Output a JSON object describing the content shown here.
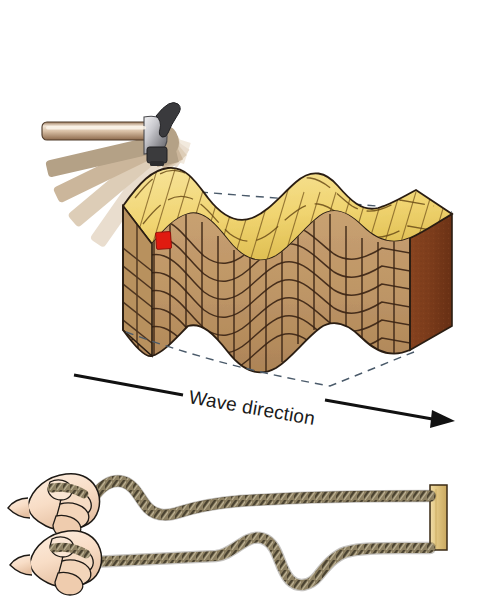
{
  "figure": {
    "background_color": "#ffffff",
    "width": 478,
    "height": 608
  },
  "panel_top": {
    "name": "hammer-and-wood-block-panel",
    "hammer": {
      "label": "hammer",
      "handle_color": "#c3a183",
      "handle_highlight": "#f3e7d8",
      "head_color": "#c8c8cc",
      "head_shadow": "#6e6e72",
      "face_color": "#3b3b3d",
      "ghost_label": "motion-blur-ghost-trail",
      "ghost_count": 5,
      "ghost_colors": [
        "#f0e6da",
        "#e6d9c8",
        "#d9c8b2",
        "#c4ae94",
        "#a8977f"
      ]
    },
    "impact_arrow": {
      "label": "impact-direction-arrow",
      "color": "#3a7ab8",
      "direction": "down"
    },
    "block": {
      "label": "wavy-wood-block",
      "top_surface_color": "#f2d97c",
      "top_surface_shadow": "#e3c55f",
      "front_face_color": "#c19a6b",
      "front_face_dark": "#a87f50",
      "side_face_color": "#7e3c1c",
      "outline_color": "#2a1d12",
      "grid_line_color": "#3a2415",
      "dashed_reference_color": "#4a5a6a",
      "marker": {
        "label": "displaced-particle-marker",
        "color": "#e01b10"
      }
    },
    "caption": {
      "text": "Wave direction",
      "color": "#1a1a1a",
      "rotation_deg": 10
    }
  },
  "panel_bottom": {
    "name": "rope-wave-panel",
    "rope": {
      "label": "rope",
      "color": "#8d8062",
      "strand_dark": "#4b4331",
      "strand_light": "#cdc3a6"
    },
    "hand": {
      "label": "hand-gripping-rope",
      "skin_color": "#fae2cf",
      "skin_shadow": "#e8c7ad",
      "outline_color": "#1e1a16"
    },
    "post": {
      "label": "fixed-wooden-post",
      "color": "#e8cf90",
      "shadow_color": "#cbab66",
      "outline_color": "#3a2a14"
    },
    "rows": [
      {
        "label": "rope-snapshot-earlier",
        "description": "single pulse near hand"
      },
      {
        "label": "rope-snapshot-later",
        "description": "pulse travelled toward post"
      }
    ]
  }
}
